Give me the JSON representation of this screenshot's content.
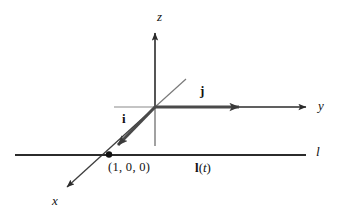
{
  "figure": {
    "background_color": "#ffffff",
    "stroke_color": "#2b2b2b",
    "thin_stroke_color": "#6e6e6e",
    "width": 339,
    "height": 220
  },
  "axes": {
    "z": {
      "label": "z",
      "origin": [
        155,
        107
      ],
      "tip": [
        155,
        27
      ],
      "tail": [
        155,
        146
      ]
    },
    "y": {
      "label": "y",
      "origin": [
        155,
        107
      ],
      "tip": [
        312,
        107
      ],
      "tail": [
        114,
        107
      ]
    },
    "x": {
      "label": "x",
      "origin": [
        155,
        107
      ],
      "tip": [
        61,
        193
      ],
      "tail": [
        186,
        79
      ]
    }
  },
  "vectors": [
    {
      "name": "i",
      "label": "i",
      "from": [
        155,
        107
      ],
      "to": [
        110,
        153
      ],
      "label_pos": [
        122,
        112
      ]
    },
    {
      "name": "j",
      "label": "j",
      "from": [
        155,
        107
      ],
      "to": [
        248,
        107
      ],
      "label_pos": [
        200,
        84
      ]
    }
  ],
  "line": {
    "label": "l",
    "param_label_bold": "l",
    "param_label_paren_open": "(",
    "param_label_italic": "t",
    "param_label_paren_close": ")",
    "from": [
      15,
      155
    ],
    "to": [
      306,
      155
    ],
    "label_pos": [
      317,
      145
    ]
  },
  "point": {
    "label": "(1, 0, 0)",
    "position": [
      109,
      154
    ],
    "label_pos": [
      110,
      161
    ]
  }
}
